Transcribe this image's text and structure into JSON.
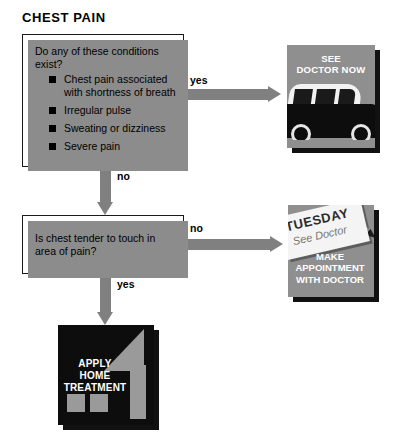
{
  "title": "CHEST PAIN",
  "colors": {
    "arrow": "#808080",
    "box_shadow": "#8c8c8c",
    "box_border": "#1a1a1a",
    "outcome_gray": "#8f8f8f",
    "outcome_dark": "#0d0d0d",
    "text": "#000000"
  },
  "boxes": {
    "symptoms": {
      "question": "Do any of these conditions exist?",
      "items": [
        "Chest pain associated with shortness of breath",
        "Irregular pulse",
        "Sweating or dizziness",
        "Severe pain"
      ]
    },
    "tender": {
      "question": "Is chest tender to touch in area of pain?"
    }
  },
  "arrows": {
    "symptoms_yes": "yes",
    "symptoms_no": "no",
    "tender_no": "no",
    "tender_yes": "yes"
  },
  "outcomes": {
    "doctor_now": {
      "caption_line1": "SEE",
      "caption_line2": "DOCTOR NOW"
    },
    "appointment": {
      "calendar_day": "TUESDAY",
      "calendar_note": "See Doctor",
      "caption_line1": "MAKE",
      "caption_line2": "APPOINTMENT",
      "caption_line3": "WITH DOCTOR"
    },
    "home_treatment": {
      "caption_line1": "APPLY",
      "caption_line2": "HOME",
      "caption_line3": "TREATMENT"
    }
  }
}
